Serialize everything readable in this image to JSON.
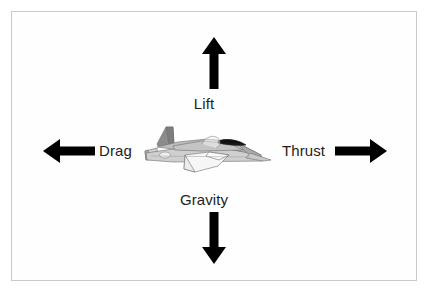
{
  "figure": {
    "type": "diagram",
    "background_color": "#ffffff",
    "border_color": "#c9c9c9",
    "label_color": "#231f20",
    "arrow_color": "#000000"
  },
  "labels": {
    "lift": "Lift",
    "gravity": "Gravity",
    "drag": "Drag",
    "thrust": "Thrust"
  },
  "arrows": {
    "lift": "arrow-up",
    "gravity": "arrow-down",
    "drag": "arrow-left",
    "thrust": "arrow-right"
  },
  "aircraft": {
    "name": "jet-airplane",
    "body_light": "#d9d9d9",
    "body_mid": "#b3b3b3",
    "body_dark": "#8c8c8c",
    "canopy": "#1a1a1a",
    "outline": "#6e6e6e",
    "wing_white": "#f4f4f4"
  }
}
